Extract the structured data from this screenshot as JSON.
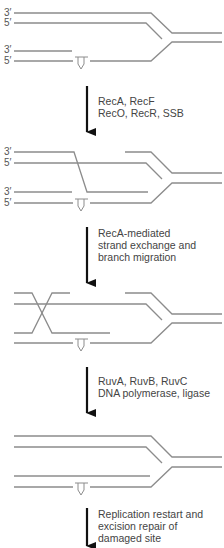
{
  "diagram": {
    "type": "process-flow",
    "colors": {
      "strand": "#8c8c8c",
      "arrow": "#111111",
      "text": "#444444"
    },
    "strand_labels": {
      "three_prime": "3′",
      "five_prime": "5′"
    },
    "lesion": {
      "icon": "thymine-dimer-icon",
      "glyph": "TT"
    },
    "stages": [
      {
        "id": "stalled-fork",
        "labels": [
          "3′",
          "5′",
          "3′",
          "5′"
        ]
      },
      {
        "id": "strand-invasion",
        "labels": [
          "3′",
          "5′",
          "3′",
          "5′"
        ]
      },
      {
        "id": "holliday-junction",
        "labels": []
      },
      {
        "id": "resolved-fork",
        "labels": []
      }
    ],
    "steps": [
      {
        "lines": [
          "RecA, RecF",
          "RecO, RecR, SSB"
        ]
      },
      {
        "lines": [
          "RecA-mediated",
          "strand exchange and",
          "branch migration"
        ]
      },
      {
        "lines": [
          "RuvA, RuvB, RuvC",
          "DNA polymerase, ligase"
        ]
      },
      {
        "lines": [
          "Replication restart and",
          "excision repair of",
          "damaged site"
        ]
      }
    ]
  }
}
